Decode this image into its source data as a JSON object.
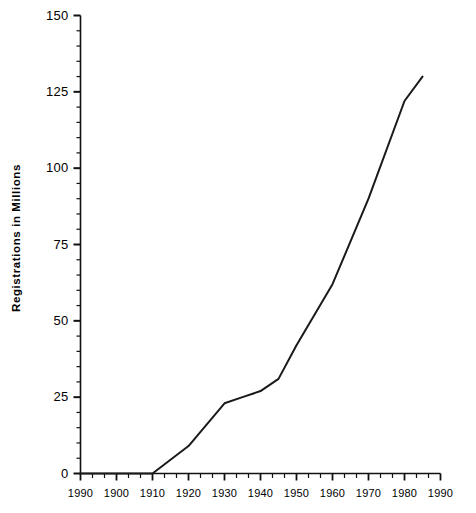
{
  "chart_data": {
    "type": "line",
    "title": "",
    "subtitle": "",
    "xlabel": "",
    "ylabel": "Registrations in Millions",
    "xlim": [
      1890,
      1990
    ],
    "ylim": [
      0,
      150
    ],
    "grid": false,
    "legend": null,
    "x_tick_labels": [
      "1990",
      "1900",
      "1910",
      "1920",
      "1930",
      "1940",
      "1950",
      "1960",
      "1970",
      "1980",
      "1990"
    ],
    "x_tick_values": [
      1890,
      1900,
      1910,
      1920,
      1930,
      1940,
      1950,
      1960,
      1970,
      1980,
      1990
    ],
    "x_minor_ticks_per_interval": 2,
    "y_tick_labels": [
      "0",
      "25",
      "50",
      "75",
      "100",
      "125",
      "150"
    ],
    "y_tick_values": [
      0,
      25,
      50,
      75,
      100,
      125,
      150
    ],
    "y_minor_ticks_per_interval": 5,
    "line_color": "#1a1a1a",
    "line_width": 2,
    "x": [
      1890,
      1900,
      1910,
      1920,
      1930,
      1935,
      1940,
      1945,
      1950,
      1960,
      1970,
      1980,
      1985
    ],
    "values": [
      0,
      0,
      0,
      9,
      23,
      25,
      27,
      31,
      42,
      62,
      90,
      122,
      130
    ],
    "series": [
      {
        "name": "Registrations",
        "x": [
          1890,
          1900,
          1910,
          1920,
          1930,
          1935,
          1940,
          1945,
          1950,
          1960,
          1970,
          1980,
          1985
        ],
        "values": [
          0,
          0,
          0,
          9,
          23,
          25,
          27,
          31,
          42,
          62,
          90,
          122,
          130
        ]
      }
    ]
  },
  "axis": {
    "y_title": "Registrations in Millions"
  }
}
